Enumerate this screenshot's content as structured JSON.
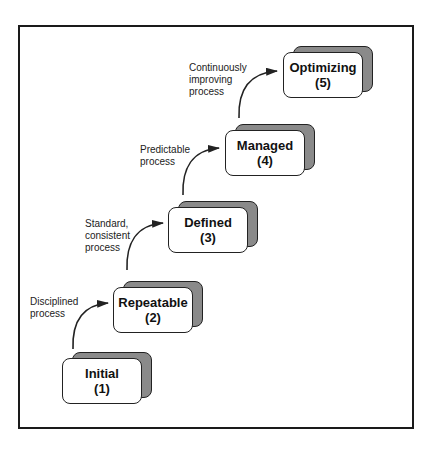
{
  "diagram": {
    "title": "",
    "stages": [
      {
        "name": "Initial",
        "level": "(1)"
      },
      {
        "name": "Repeatable",
        "level": "(2)"
      },
      {
        "name": "Defined",
        "level": "(3)"
      },
      {
        "name": "Managed",
        "level": "(4)"
      },
      {
        "name": "Optimizing",
        "level": "(5)"
      }
    ],
    "transitions": [
      {
        "from": "Initial",
        "to": "Repeatable",
        "label": "Disciplined\nprocess"
      },
      {
        "from": "Repeatable",
        "to": "Defined",
        "label": "Standard,\nconsistent\nprocess"
      },
      {
        "from": "Defined",
        "to": "Managed",
        "label": "Predictable\nprocess"
      },
      {
        "from": "Managed",
        "to": "Optimizing",
        "label": "Continuously\nimproving\nprocess"
      }
    ],
    "colors": {
      "frame": "#1a1a1a",
      "box_fill": "#ffffff",
      "box_shadow": "#8a8a8a",
      "arrow": "#222222"
    }
  }
}
